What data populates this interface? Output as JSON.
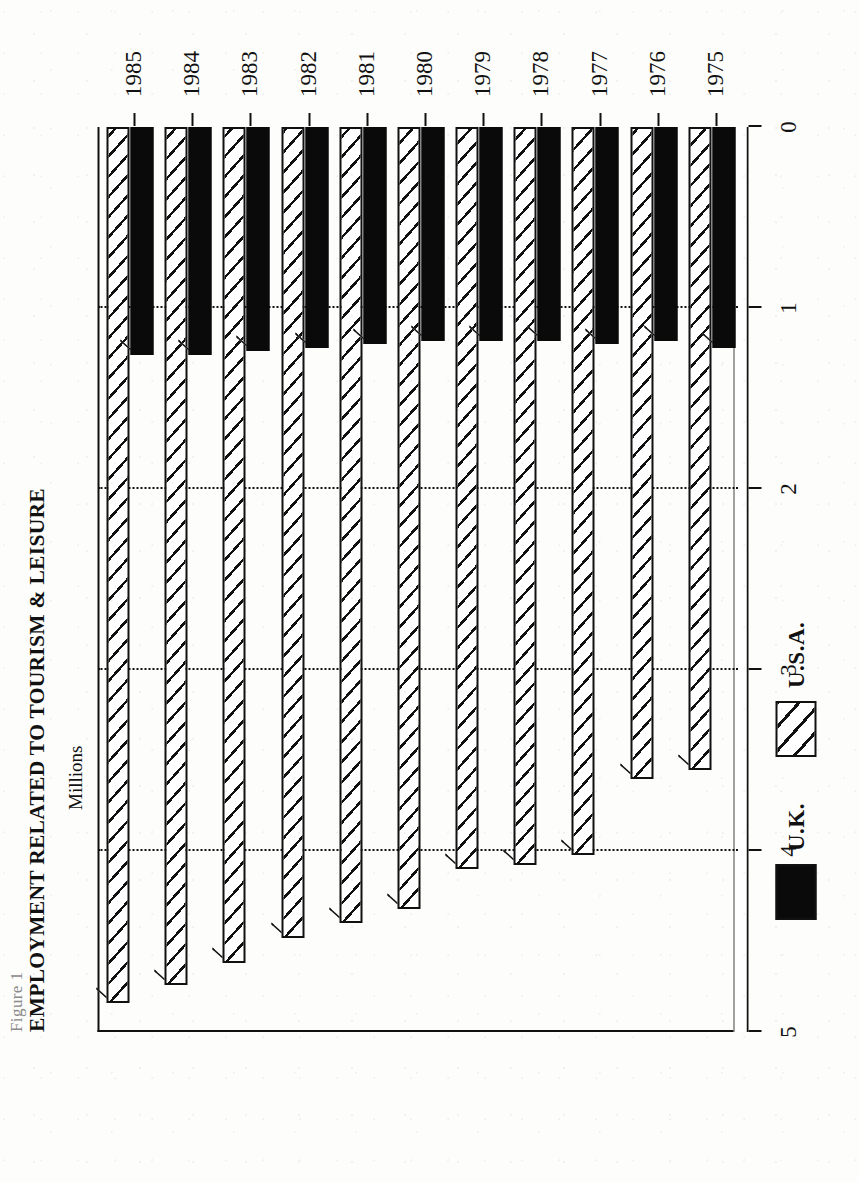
{
  "figure": {
    "label": "Figure 1",
    "title": "EMPLOYMENT RELATED TO TOURISM & LEISURE",
    "axis_label": "Millions"
  },
  "legend": {
    "position": "bottom-left",
    "items": [
      {
        "label": "U.K.",
        "swatch": "solid-black-swatch",
        "color": "#0a0a0a"
      },
      {
        "label": "U.S.A.",
        "swatch": "hatched-swatch",
        "color": "#ffffff"
      }
    ]
  },
  "value_axis": {
    "ticks": [
      "0",
      "1",
      "2",
      "3",
      "4",
      "5"
    ],
    "min": 0,
    "max": 5
  },
  "chart_data": {
    "type": "bar",
    "orientation": "horizontal",
    "title": "EMPLOYMENT RELATED TO TOURISM & LEISURE",
    "subtitle": "Figure 1",
    "xlabel": "Millions",
    "ylabel": "",
    "ylim": [
      0,
      5
    ],
    "grid": true,
    "legend_position": "bottom-left",
    "categories": [
      "1975",
      "1976",
      "1977",
      "1978",
      "1979",
      "1980",
      "1981",
      "1982",
      "1983",
      "1984",
      "1985"
    ],
    "series": [
      {
        "name": "U.K.",
        "color": "#0a0a0a",
        "values": [
          1.22,
          1.18,
          1.2,
          1.18,
          1.18,
          1.18,
          1.2,
          1.22,
          1.24,
          1.26,
          1.26
        ]
      },
      {
        "name": "U.S.A.",
        "color": "#ffffff",
        "values": [
          3.55,
          3.6,
          4.02,
          4.08,
          4.1,
          4.32,
          4.4,
          4.48,
          4.62,
          4.74,
          4.84
        ]
      }
    ]
  }
}
